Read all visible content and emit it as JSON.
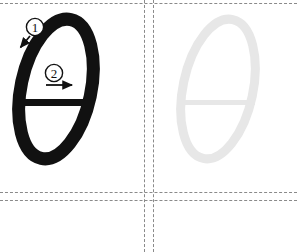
{
  "worksheet": {
    "kind": "handwriting-practice-worksheet",
    "letter": "θ",
    "letter_name": "theta",
    "width": 297,
    "height": 252,
    "background_color": "#ffffff"
  },
  "grid": {
    "rule_color": "#8a8a8a",
    "rule_style": "dashed",
    "horizontal_rules": [
      3,
      192,
      200
    ],
    "vertical_rules": [
      144,
      153
    ]
  },
  "cells": [
    {
      "name": "model",
      "role": "stroke-order-example",
      "character": "θ",
      "ink_color": "#111111",
      "x": 0,
      "y": 3,
      "width": 144,
      "height": 189
    },
    {
      "name": "trace",
      "role": "tracing-guide",
      "character": "θ",
      "ink_color": "#e7e7e7",
      "x": 153,
      "y": 3,
      "width": 144,
      "height": 189
    }
  ],
  "stroke_order": [
    {
      "number": "1",
      "label": "①",
      "description": "oval body, start top-right and sweep down-left",
      "badge_cx": 35,
      "badge_cy": 24,
      "arrow_from": [
        30,
        33
      ],
      "arrow_to": [
        20,
        45
      ]
    },
    {
      "number": "2",
      "label": "②",
      "description": "horizontal crossbar, left to right",
      "badge_cx": 54,
      "badge_cy": 70,
      "arrow_from": [
        46,
        82
      ],
      "arrow_to": [
        74,
        82
      ]
    }
  ]
}
